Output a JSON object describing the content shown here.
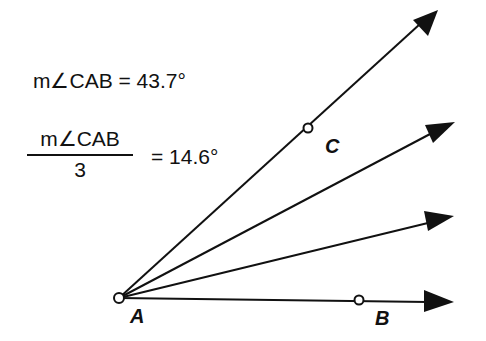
{
  "equations": {
    "angle_measure": "m∠CAB = 43.7°",
    "fraction_numerator": "m∠CAB",
    "fraction_denominator": "3",
    "fraction_result": "= 14.6°"
  },
  "points": {
    "A": "A",
    "B": "B",
    "C": "C"
  },
  "colors": {
    "ink": "#111111",
    "background": "#ffffff"
  }
}
